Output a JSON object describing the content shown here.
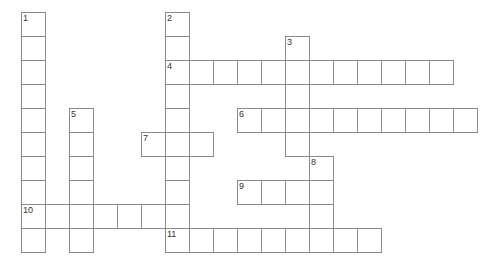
{
  "puzzle": {
    "grid": {
      "origin_x": 21,
      "origin_y": 12,
      "cell_size": 24,
      "line_color": "#8a8a8a"
    },
    "entries": [
      {
        "number": "1",
        "direction": "down",
        "row": 0,
        "col": 0,
        "length": 10
      },
      {
        "number": "2",
        "direction": "down",
        "row": 0,
        "col": 6,
        "length": 10
      },
      {
        "number": "3",
        "direction": "down",
        "row": 1,
        "col": 11,
        "length": 5
      },
      {
        "number": "4",
        "direction": "across",
        "row": 2,
        "col": 6,
        "length": 12
      },
      {
        "number": "5",
        "direction": "down",
        "row": 4,
        "col": 2,
        "length": 6
      },
      {
        "number": "6",
        "direction": "across",
        "row": 4,
        "col": 9,
        "length": 10
      },
      {
        "number": "7",
        "direction": "across",
        "row": 5,
        "col": 5,
        "length": 3
      },
      {
        "number": "8",
        "direction": "down",
        "row": 6,
        "col": 12,
        "length": 4
      },
      {
        "number": "9",
        "direction": "across",
        "row": 7,
        "col": 9,
        "length": 4
      },
      {
        "number": "10",
        "direction": "across",
        "row": 8,
        "col": 0,
        "length": 7
      },
      {
        "number": "11",
        "direction": "across",
        "row": 9,
        "col": 6,
        "length": 9
      }
    ]
  }
}
